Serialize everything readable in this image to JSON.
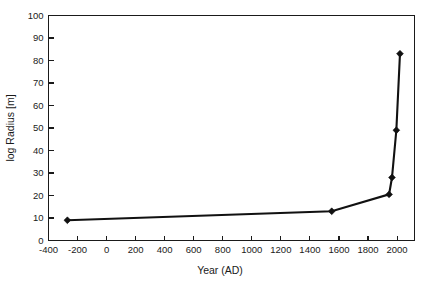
{
  "chart_data": {
    "type": "line",
    "title": "",
    "xlabel": "Year (AD)",
    "ylabel": "log Radius [m]",
    "xlim": [
      -400,
      2120
    ],
    "ylim": [
      0,
      100
    ],
    "grid": false,
    "legend": null,
    "xticks": [
      -400,
      -200,
      0,
      200,
      400,
      600,
      800,
      1000,
      1200,
      1400,
      1600,
      1800,
      2000
    ],
    "xtick_labels": [
      "-400",
      "-200",
      "0",
      "200",
      "400",
      "600",
      "800",
      "1000",
      "1200",
      "1400",
      "1600",
      "1800",
      "2000"
    ],
    "yticks": [
      0,
      10,
      20,
      30,
      40,
      50,
      60,
      70,
      80,
      90,
      100
    ],
    "ytick_labels": [
      "0",
      "10",
      "20",
      "30",
      "40",
      "50",
      "60",
      "70",
      "80",
      "90",
      "100"
    ],
    "series": [
      {
        "name": "log Radius",
        "marker": "diamond",
        "color": "#111111",
        "x": [
          -270,
          1550,
          1945,
          1965,
          1995,
          2020
        ],
        "y": [
          9,
          13,
          20.5,
          28,
          49,
          83
        ]
      }
    ]
  }
}
